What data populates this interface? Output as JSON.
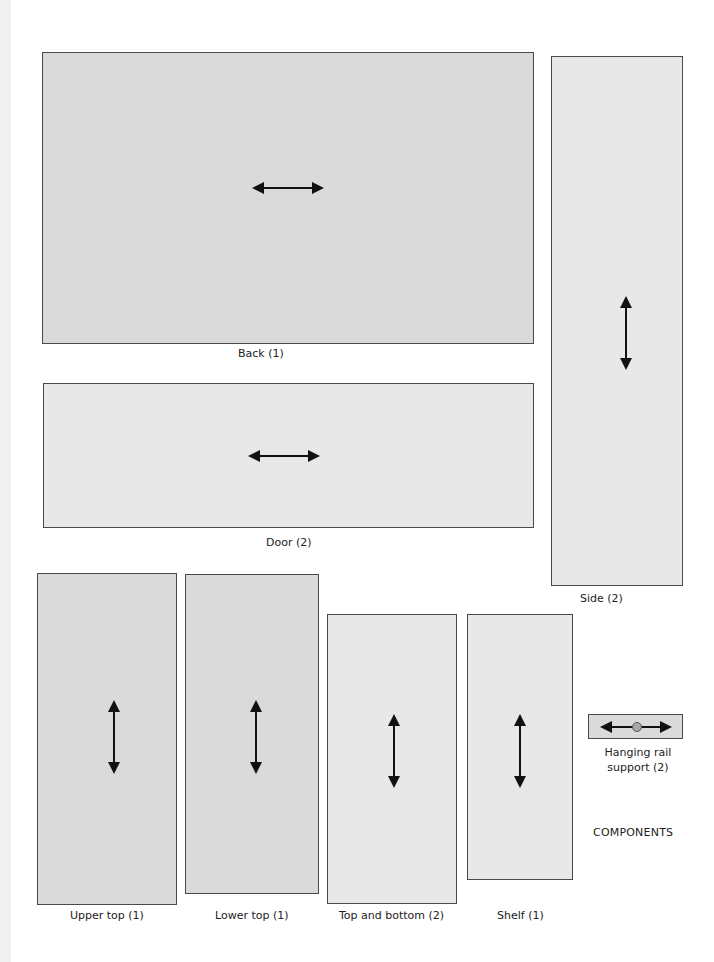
{
  "diagram": {
    "caption": "COMPONENTS",
    "panels": [
      {
        "id": "back",
        "label": "Back (1)",
        "grain": "horizontal"
      },
      {
        "id": "door",
        "label": "Door (2)",
        "grain": "horizontal"
      },
      {
        "id": "side",
        "label": "Side (2)",
        "grain": "vertical"
      },
      {
        "id": "upper-top",
        "label": "Upper top (1)",
        "grain": "vertical"
      },
      {
        "id": "lower-top",
        "label": "Lower top (1)",
        "grain": "vertical"
      },
      {
        "id": "top-bottom",
        "label": "Top and bottom (2)",
        "grain": "vertical"
      },
      {
        "id": "shelf",
        "label": "Shelf (1)",
        "grain": "vertical"
      },
      {
        "id": "hanging-rail-support",
        "label_line1": "Hanging rail",
        "label_line2": "support (2)",
        "grain": "horizontal"
      }
    ],
    "colors": {
      "dark_panel": "#dadada",
      "light_panel": "#e8e8e8",
      "outline": "#4a4a4a",
      "arrow": "#111111"
    }
  }
}
